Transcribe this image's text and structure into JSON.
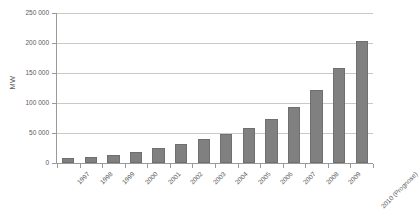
{
  "chart_data": {
    "type": "bar",
    "title": "",
    "subtitle": "",
    "xlabel": "",
    "ylabel": "MW",
    "ylim": [
      0,
      250000
    ],
    "ytick_labels": [
      "250 000",
      "200 000",
      "150 000",
      "100 000",
      "50 000",
      "0"
    ],
    "ytick_values": [
      250000,
      200000,
      150000,
      100000,
      50000,
      0
    ],
    "grid": "horizontal",
    "legend": "none",
    "bar_color": "#808080",
    "bar_edge_color": "#6f6f6f",
    "background_color": "#ffffff",
    "gridline_color": "#c9c9c9",
    "axis_color": "#9a9a9a",
    "categories": [
      "1997",
      "1998",
      "1999",
      "2000",
      "2001",
      "2002",
      "2003",
      "2004",
      "2005",
      "2006",
      "2007",
      "2008",
      "2009",
      "2010 (Prognose)"
    ],
    "values": [
      7600,
      10200,
      13600,
      18000,
      24300,
      31100,
      39400,
      47600,
      59000,
      74000,
      94000,
      121000,
      159000,
      203000
    ],
    "series": [
      {
        "name": "MW",
        "values": [
          7600,
          10200,
          13600,
          18000,
          24300,
          31100,
          39400,
          47600,
          59000,
          74000,
          94000,
          121000,
          159000,
          203000
        ]
      }
    ]
  }
}
